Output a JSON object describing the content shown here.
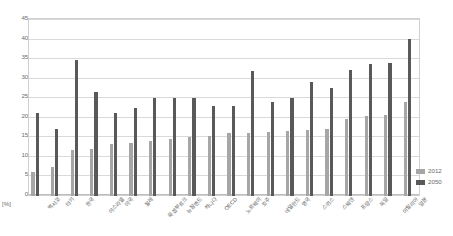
{
  "chart_data": {
    "type": "bar",
    "title": "",
    "xlabel": "",
    "ylabel": "[%]",
    "ylim": [
      0,
      45
    ],
    "yticks": [
      0,
      5,
      10,
      15,
      20,
      25,
      30,
      35,
      40,
      45
    ],
    "grid": true,
    "legend_position": "right",
    "categories": [
      "멕시코",
      "터키",
      "한국",
      "이스라엘",
      "미국",
      "칠레",
      "룩셈부르크",
      "뉴질랜드",
      "캐나다",
      "OECD",
      "노르웨이",
      "호주",
      "네덜란드",
      "영국",
      "스위스",
      "스웨덴",
      "프랑스",
      "독일",
      "이탈리아",
      "일본"
    ],
    "series": [
      {
        "name": "2012",
        "color": "#a6a6a6",
        "values": [
          6.1,
          7.3,
          11.8,
          12.0,
          13.2,
          13.6,
          13.9,
          14.6,
          14.9,
          15.2,
          15.9,
          16.0,
          16.2,
          16.5,
          16.8,
          17.0,
          19.5,
          20.3,
          20.5,
          23.8
        ]
      },
      {
        "name": "2050",
        "color": "#595959",
        "values": [
          21.0,
          17.0,
          34.5,
          26.5,
          21.0,
          22.5,
          25.0,
          24.8,
          25.0,
          23.0,
          22.8,
          31.8,
          24.0,
          25.0,
          29.0,
          27.5,
          32.0,
          33.5,
          33.8,
          40.0
        ]
      }
    ]
  },
  "legend": {
    "items": [
      {
        "label": "2012",
        "color": "#a6a6a6"
      },
      {
        "label": "2050",
        "color": "#595959"
      }
    ]
  },
  "axis": {
    "unit_label": "[%]"
  }
}
